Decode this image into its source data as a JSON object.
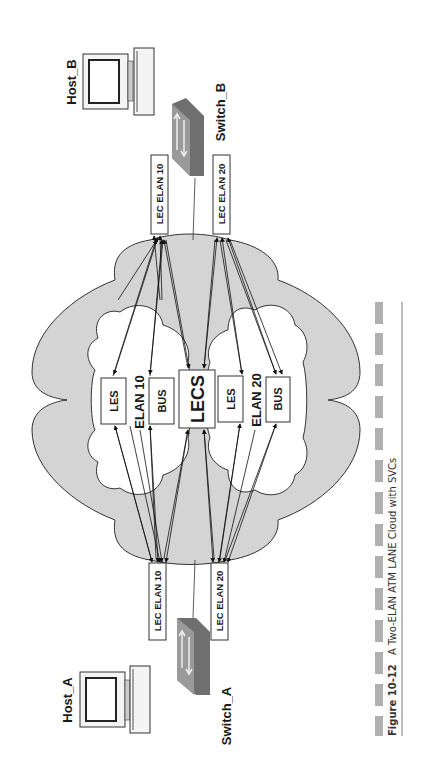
{
  "figure": {
    "number": "Figure 10-12",
    "caption": "A Two-ELAN ATM LANE Cloud with SVCs"
  },
  "hosts": [
    {
      "id": "host_a",
      "label": "Host_A"
    },
    {
      "id": "host_b",
      "label": "Host_B"
    }
  ],
  "switches": [
    {
      "id": "switch_a",
      "label": "Switch_A"
    },
    {
      "id": "switch_b",
      "label": "Switch_B"
    }
  ],
  "lec_clients": {
    "a_elan10": "LEC ELAN 10",
    "a_elan20": "LEC ELAN 20",
    "b_elan10": "LEC ELAN 10",
    "b_elan20": "LEC ELAN 20"
  },
  "elans": [
    {
      "name": "ELAN 10",
      "les": "LES",
      "bus": "BUS"
    },
    {
      "name": "ELAN 20",
      "les": "LES",
      "bus": "BUS"
    }
  ],
  "lecs": "LECS",
  "colors": {
    "cloud_fill": "#d4d4d4",
    "inner_cloud_fill": "#ffffff",
    "switch_fill": "#8c8c8c",
    "caption_bar": "#b0b0b0",
    "stroke": "#222222"
  }
}
